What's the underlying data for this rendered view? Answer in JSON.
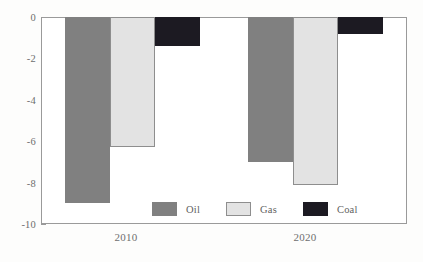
{
  "chart_data": {
    "type": "bar",
    "title": "",
    "xlabel": "",
    "ylabel": "",
    "categories": [
      "2010",
      "2020"
    ],
    "series": [
      {
        "name": "Oil",
        "values": [
          -9.0,
          -7.0
        ],
        "color": "#808080"
      },
      {
        "name": "Gas",
        "values": [
          -6.3,
          -8.1
        ],
        "color": "#e3e3e3"
      },
      {
        "name": "Coal",
        "values": [
          -1.4,
          -0.8
        ],
        "color": "#1c1a22"
      }
    ],
    "ylim": [
      -10,
      0
    ],
    "y_ticks": [
      "0",
      "-2",
      "-4",
      "-6",
      "-8",
      "-10"
    ],
    "y_tick_values": [
      0,
      -2,
      -4,
      -6,
      -8,
      -10
    ],
    "y_minor_tick_values": [
      -1,
      -3,
      -5,
      -7,
      -9
    ],
    "grid": false,
    "legend_position": "inside-bottom-center",
    "legend_entries": [
      "Oil",
      "Gas",
      "Coal"
    ]
  }
}
